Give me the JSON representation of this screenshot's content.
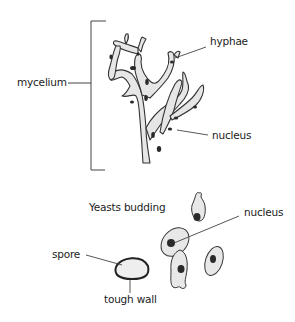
{
  "diagram": {
    "top": {
      "labels": {
        "mycelium": "mycelium",
        "hyphae": "hyphae",
        "nucleus": "nucleus"
      }
    },
    "bottom": {
      "title": "Yeasts budding",
      "labels": {
        "nucleus": "nucleus",
        "spore": "spore",
        "tough_wall": "tough wall"
      }
    },
    "colors": {
      "outline": "#333333",
      "fill": "#e8e8e8",
      "nucleus": "#2a2a2a"
    }
  }
}
